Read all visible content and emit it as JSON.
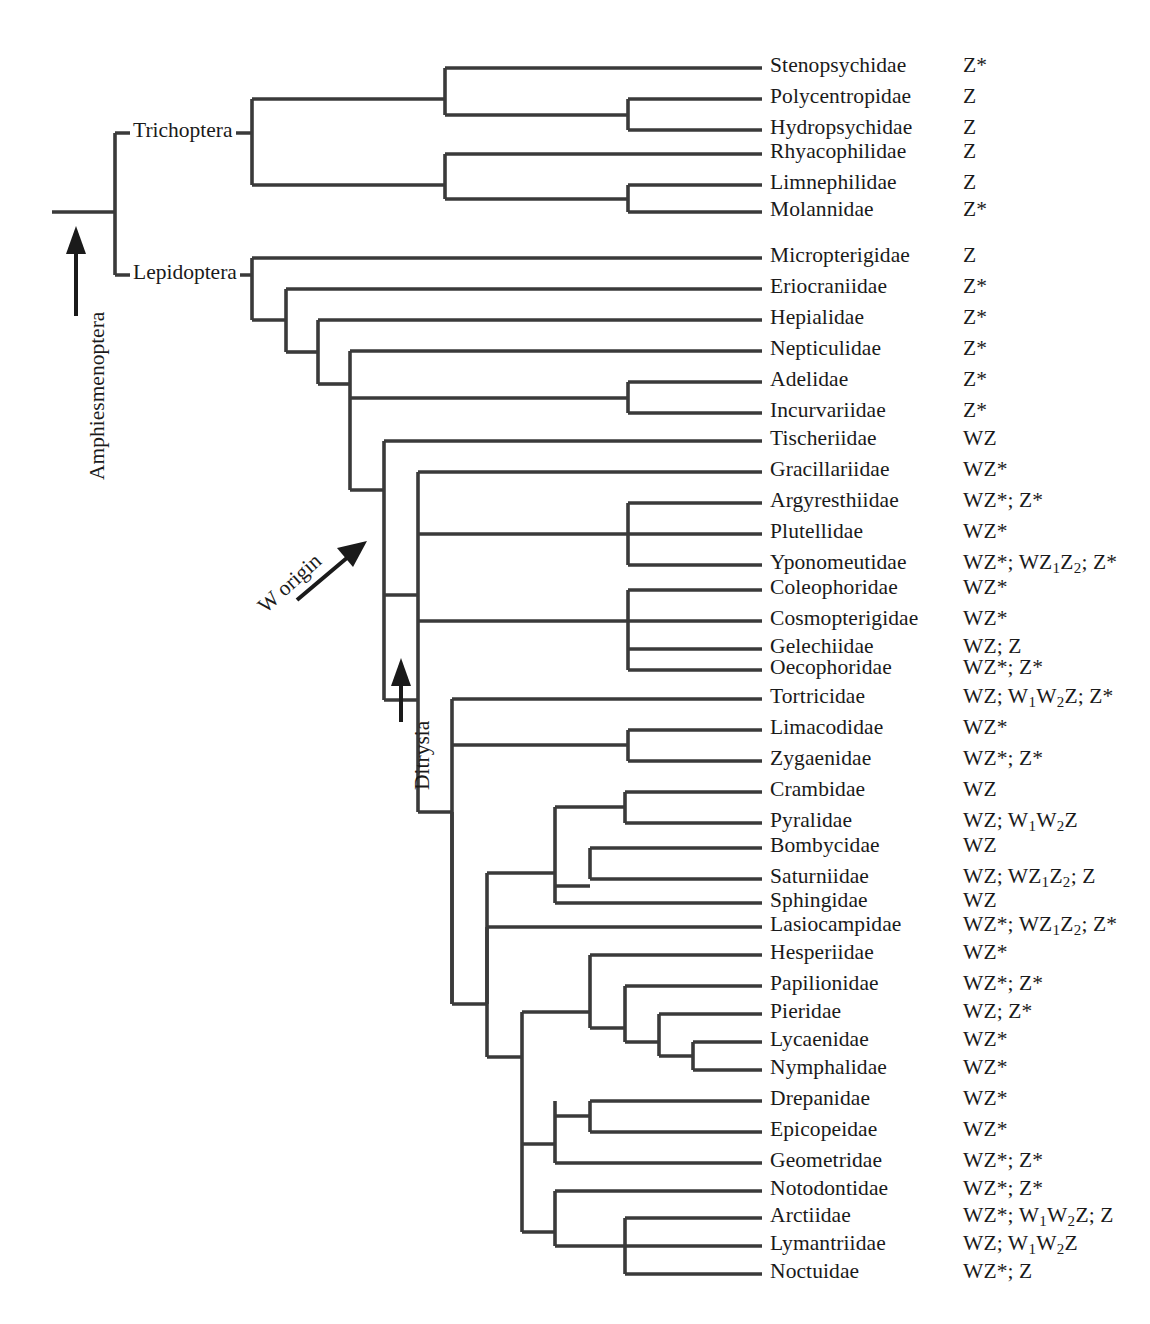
{
  "figure": {
    "type": "cladogram",
    "orientation": "left-to-right",
    "line_color": "#3a3a3a",
    "text_color": "#1a1a1a",
    "background": "#ffffff"
  },
  "clade_labels": [
    {
      "id": "trichoptera",
      "text": "Trichoptera",
      "x": 130,
      "y": 133
    },
    {
      "id": "lepidoptera",
      "text": "Lepidoptera",
      "x": 130,
      "y": 275
    }
  ],
  "vertical_labels": [
    {
      "id": "amphiesmenoptera",
      "text": "Amphiesmenoptera",
      "x": 85,
      "y": 480,
      "arrow": "up"
    },
    {
      "id": "ditrysia",
      "text": "Ditrysia",
      "x": 410,
      "y": 790,
      "arrow": "up"
    }
  ],
  "annotations": [
    {
      "id": "w-origin",
      "text": "W origin",
      "x": 253,
      "y": 600,
      "arrow": "diagonal-up-right"
    }
  ],
  "taxa": [
    {
      "name": "Stenopsychidae",
      "karyotype": "Z*",
      "y": 68
    },
    {
      "name": "Polycentropidae",
      "karyotype": "Z",
      "y": 99
    },
    {
      "name": "Hydropsychidae",
      "karyotype": "Z",
      "y": 130
    },
    {
      "name": "Rhyacophilidae",
      "karyotype": "Z",
      "y": 154
    },
    {
      "name": "Limnephilidae",
      "karyotype": "Z",
      "y": 185
    },
    {
      "name": "Molannidae",
      "karyotype": "Z*",
      "y": 212
    },
    {
      "name": "Micropterigidae",
      "karyotype": "Z",
      "y": 258
    },
    {
      "name": "Eriocraniidae",
      "karyotype": "Z*",
      "y": 289
    },
    {
      "name": "Hepialidae",
      "karyotype": "Z*",
      "y": 320
    },
    {
      "name": "Nepticulidae",
      "karyotype": "Z*",
      "y": 351
    },
    {
      "name": "Adelidae",
      "karyotype": "Z*",
      "y": 382
    },
    {
      "name": "Incurvariidae",
      "karyotype": "Z*",
      "y": 413
    },
    {
      "name": "Tischeriidae",
      "karyotype": "WZ",
      "y": 441
    },
    {
      "name": "Gracillariidae",
      "karyotype": "WZ*",
      "y": 472
    },
    {
      "name": "Argyresthiidae",
      "karyotype": "WZ*; Z*",
      "y": 503
    },
    {
      "name": "Plutellidae",
      "karyotype": "WZ*",
      "y": 534
    },
    {
      "name": "Yponomeutidae",
      "karyotype": "WZ*; WZ_1Z_2; Z*",
      "y": 565
    },
    {
      "name": "Coleophoridae",
      "karyotype": "WZ*",
      "y": 590
    },
    {
      "name": "Cosmopterigidae",
      "karyotype": "WZ*",
      "y": 621
    },
    {
      "name": "Gelechiidae",
      "karyotype": "WZ; Z",
      "y": 649
    },
    {
      "name": "Oecophoridae",
      "karyotype": "WZ*; Z*",
      "y": 670
    },
    {
      "name": "Tortricidae",
      "karyotype": "WZ; W_1W_2Z; Z*",
      "y": 699
    },
    {
      "name": "Limacodidae",
      "karyotype": "WZ*",
      "y": 730
    },
    {
      "name": "Zygaenidae",
      "karyotype": "WZ*; Z*",
      "y": 761
    },
    {
      "name": "Crambidae",
      "karyotype": "WZ",
      "y": 792
    },
    {
      "name": "Pyralidae",
      "karyotype": "WZ; W_1W_2Z",
      "y": 823
    },
    {
      "name": "Bombycidae",
      "karyotype": "WZ",
      "y": 848
    },
    {
      "name": "Saturniidae",
      "karyotype": "WZ; WZ_1Z_2; Z",
      "y": 879
    },
    {
      "name": "Sphingidae",
      "karyotype": "WZ",
      "y": 903
    },
    {
      "name": "Lasiocampidae",
      "karyotype": "WZ*; WZ_1Z_2; Z*",
      "y": 927
    },
    {
      "name": "Hesperiidae",
      "karyotype": "WZ*",
      "y": 955
    },
    {
      "name": "Papilionidae",
      "karyotype": "WZ*; Z*",
      "y": 986
    },
    {
      "name": "Pieridae",
      "karyotype": "WZ; Z*",
      "y": 1014
    },
    {
      "name": "Lycaenidae",
      "karyotype": "WZ*",
      "y": 1042
    },
    {
      "name": "Nymphalidae",
      "karyotype": "WZ*",
      "y": 1070
    },
    {
      "name": "Drepanidae",
      "karyotype": "WZ*",
      "y": 1101
    },
    {
      "name": "Epicopeidae",
      "karyotype": "WZ*",
      "y": 1132
    },
    {
      "name": "Geometridae",
      "karyotype": "WZ*; Z*",
      "y": 1163
    },
    {
      "name": "Notodontidae",
      "karyotype": "WZ*; Z*",
      "y": 1191
    },
    {
      "name": "Arctiidae",
      "karyotype": "WZ*; W_1W_2Z; Z",
      "y": 1218
    },
    {
      "name": "Lymantriidae",
      "karyotype": "WZ; W_1W_2Z",
      "y": 1246
    },
    {
      "name": "Noctuidae",
      "karyotype": "WZ*; Z",
      "y": 1274
    }
  ],
  "layout": {
    "tip_x": 762,
    "name_x": 770,
    "karyo_x": 963,
    "root_stem_x0": 52,
    "root_x": 115
  },
  "edges": {
    "h": [
      [
        52,
        115,
        212
      ],
      [
        115,
        252,
        133
      ],
      [
        115,
        252,
        275
      ],
      [
        252,
        445,
        99
      ],
      [
        252,
        445,
        185
      ],
      [
        445,
        762,
        68
      ],
      [
        445,
        628,
        115
      ],
      [
        628,
        762,
        99
      ],
      [
        628,
        762,
        130
      ],
      [
        445,
        762,
        154
      ],
      [
        445,
        628,
        199
      ],
      [
        628,
        762,
        185
      ],
      [
        628,
        762,
        212
      ],
      [
        252,
        762,
        258
      ],
      [
        252,
        286,
        320
      ],
      [
        286,
        762,
        289
      ],
      [
        286,
        318,
        352
      ],
      [
        318,
        762,
        320
      ],
      [
        318,
        350,
        384
      ],
      [
        350,
        762,
        351
      ],
      [
        350,
        628,
        398
      ],
      [
        628,
        762,
        382
      ],
      [
        628,
        762,
        413
      ],
      [
        350,
        384,
        490
      ],
      [
        384,
        762,
        441
      ],
      [
        384,
        418,
        595
      ],
      [
        418,
        762,
        472
      ],
      [
        418,
        628,
        534
      ],
      [
        628,
        762,
        503
      ],
      [
        628,
        762,
        534
      ],
      [
        628,
        762,
        565
      ],
      [
        418,
        628,
        621
      ],
      [
        628,
        762,
        590
      ],
      [
        628,
        762,
        621
      ],
      [
        628,
        762,
        649
      ],
      [
        628,
        762,
        670
      ],
      [
        384,
        418,
        700
      ],
      [
        418,
        452,
        812
      ],
      [
        452,
        762,
        699
      ],
      [
        452,
        628,
        745
      ],
      [
        628,
        762,
        730
      ],
      [
        628,
        762,
        761
      ],
      [
        452,
        487,
        1004
      ],
      [
        487,
        555,
        873
      ],
      [
        555,
        625,
        807
      ],
      [
        625,
        762,
        792
      ],
      [
        625,
        762,
        823
      ],
      [
        555,
        590,
        886
      ],
      [
        590,
        762,
        848
      ],
      [
        590,
        762,
        879
      ],
      [
        555,
        762,
        903
      ],
      [
        487,
        762,
        927
      ],
      [
        487,
        522,
        1057
      ],
      [
        522,
        590,
        1012
      ],
      [
        590,
        762,
        955
      ],
      [
        590,
        625,
        1028
      ],
      [
        625,
        762,
        986
      ],
      [
        625,
        659,
        1042
      ],
      [
        659,
        762,
        1014
      ],
      [
        659,
        693,
        1056
      ],
      [
        693,
        762,
        1042
      ],
      [
        693,
        762,
        1070
      ],
      [
        522,
        555,
        1144
      ],
      [
        555,
        590,
        1116
      ],
      [
        590,
        762,
        1101
      ],
      [
        590,
        762,
        1132
      ],
      [
        555,
        762,
        1163
      ],
      [
        522,
        555,
        1232
      ],
      [
        555,
        762,
        1191
      ],
      [
        555,
        625,
        1246
      ],
      [
        625,
        762,
        1218
      ],
      [
        625,
        762,
        1246
      ],
      [
        625,
        762,
        1274
      ]
    ],
    "v": [
      [
        115,
        133,
        275
      ],
      [
        252,
        99,
        185
      ],
      [
        445,
        68,
        115
      ],
      [
        628,
        99,
        130
      ],
      [
        445,
        154,
        199
      ],
      [
        628,
        185,
        212
      ],
      [
        252,
        258,
        320
      ],
      [
        286,
        289,
        352
      ],
      [
        318,
        320,
        384
      ],
      [
        350,
        351,
        490
      ],
      [
        628,
        382,
        413
      ],
      [
        384,
        441,
        700
      ],
      [
        418,
        472,
        621
      ],
      [
        628,
        503,
        565
      ],
      [
        628,
        590,
        670
      ],
      [
        452,
        699,
        1004
      ],
      [
        628,
        730,
        761
      ],
      [
        487,
        873,
        1057
      ],
      [
        555,
        807,
        903
      ],
      [
        625,
        792,
        823
      ],
      [
        590,
        848,
        879
      ],
      [
        522,
        1012,
        1144
      ],
      [
        590,
        955,
        1028
      ],
      [
        625,
        986,
        1042
      ],
      [
        659,
        1014,
        1056
      ],
      [
        693,
        1042,
        1070
      ],
      [
        555,
        1101,
        1163
      ],
      [
        590,
        1101,
        1132
      ],
      [
        555,
        1191,
        1246
      ],
      [
        625,
        1218,
        1274
      ],
      [
        487,
        927,
        1004
      ],
      [
        522,
        1144,
        1232
      ],
      [
        418,
        621,
        812
      ],
      [
        452,
        812,
        1004
      ]
    ]
  }
}
